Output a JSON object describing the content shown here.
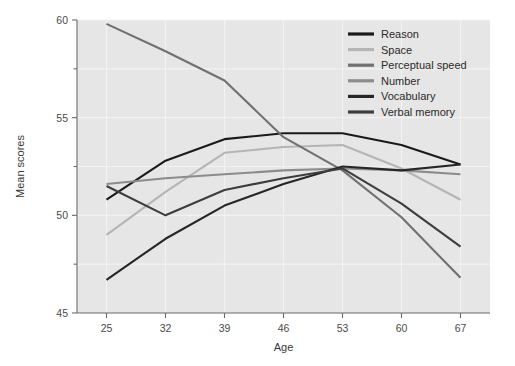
{
  "chart_data": {
    "type": "line",
    "title": "",
    "xlabel": "Age",
    "ylabel": "Mean scores",
    "x": [
      25,
      32,
      39,
      46,
      53,
      60,
      67
    ],
    "categories": [
      "25",
      "32",
      "39",
      "46",
      "53",
      "60",
      "67"
    ],
    "xlim": [
      21.5,
      70.5
    ],
    "ylim": [
      45,
      60
    ],
    "yticks": [
      45,
      50,
      55,
      60
    ],
    "yticks_minor": [
      47.5,
      52.5,
      57.5
    ],
    "ytick_labels": [
      "45",
      "50",
      "55",
      "60"
    ],
    "grid": true,
    "grid_axis": "both",
    "legend_position": "top-right",
    "series": [
      {
        "name": "Reason",
        "color": "#1a1a1a",
        "values": [
          50.8,
          52.8,
          53.9,
          54.2,
          54.2,
          53.6,
          52.6
        ]
      },
      {
        "name": "Space",
        "color": "#b5b5b5",
        "values": [
          49.0,
          51.2,
          53.2,
          53.5,
          53.6,
          52.4,
          50.8
        ]
      },
      {
        "name": "Perceptual speed",
        "color": "#707070",
        "values": [
          59.8,
          58.4,
          56.9,
          54.0,
          52.3,
          49.9,
          46.8
        ]
      },
      {
        "name": "Number",
        "color": "#8c8c8c",
        "values": [
          51.6,
          51.9,
          52.1,
          52.3,
          52.4,
          52.3,
          52.1
        ]
      },
      {
        "name": "Vocabulary",
        "color": "#262626",
        "values": [
          46.7,
          48.8,
          50.5,
          51.6,
          52.5,
          52.3,
          52.6
        ]
      },
      {
        "name": "Verbal memory",
        "color": "#3d3d3d",
        "values": [
          51.5,
          50.0,
          51.3,
          51.9,
          52.4,
          50.6,
          48.4
        ]
      }
    ]
  },
  "legend": {
    "items": [
      {
        "label": "Reason"
      },
      {
        "label": "Space"
      },
      {
        "label": "Perceptual speed"
      },
      {
        "label": "Number"
      },
      {
        "label": "Vocabulary"
      },
      {
        "label": "Verbal memory"
      }
    ]
  }
}
